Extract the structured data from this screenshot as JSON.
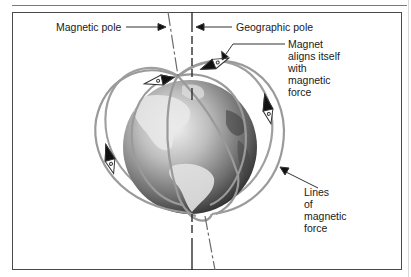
{
  "figure": {
    "type": "labeled-illustration",
    "labels": {
      "magnetic_pole": "Magnetic pole",
      "geographic_pole": "Geographic pole",
      "magnet_aligns": [
        "Magnet",
        "aligns itself",
        "with",
        "magnetic",
        "force"
      ],
      "field_lines": [
        "Lines",
        "of",
        "magnetic",
        "force"
      ]
    },
    "colors": {
      "field_line": "#9a9a9a",
      "pole_line": "#333333",
      "frame": "#4a4a4a",
      "globe_light": "#e6e6e6",
      "globe_dark": "#2a2a2a"
    },
    "compass_count": 4
  }
}
